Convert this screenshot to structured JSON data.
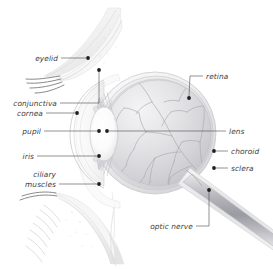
{
  "figure": {
    "type": "anatomical-diagram",
    "background_color": "#ffffff",
    "label_color": "#3c3c3c",
    "leader_color": "#4a4a4a",
    "marker_color": "#1e1e1e",
    "width": 273,
    "height": 269
  },
  "labels": {
    "eyelid": "eyelid",
    "conjunctiva": "conjunctiva",
    "cornea": "cornea",
    "pupil": "pupil",
    "iris": "iris",
    "ciliary_line1": "ciliary",
    "ciliary_line2": "muscles",
    "retina": "retina",
    "lens": "lens",
    "choroid": "choroid",
    "sclera": "sclera",
    "optic_nerve": "optic nerve"
  },
  "markers": {
    "eyelid": {
      "x": 88,
      "y": 58
    },
    "conjunctiva": {
      "x": 99,
      "y": 70
    },
    "cornea": {
      "x": 77,
      "y": 113
    },
    "pupil": {
      "x": 99,
      "y": 131
    },
    "iris": {
      "x": 99,
      "y": 156
    },
    "ciliary_muscles": {
      "x": 99,
      "y": 184
    },
    "retina": {
      "x": 189,
      "y": 98
    },
    "lens": {
      "x": 107,
      "y": 131
    },
    "choroid": {
      "x": 214,
      "y": 151
    },
    "sclera": {
      "x": 214,
      "y": 168
    },
    "optic_nerve": {
      "x": 209,
      "y": 190
    }
  },
  "anatomy": {
    "eyeball": {
      "cx": 155,
      "cy": 133,
      "r": 61
    },
    "vitreous": {
      "cx": 158,
      "cy": 133,
      "rx": 53,
      "ry": 53
    },
    "lens_body": {
      "cx": 104,
      "cy": 134,
      "rx": 14,
      "ry": 27
    },
    "optic_nerve_angle_deg": 33
  }
}
